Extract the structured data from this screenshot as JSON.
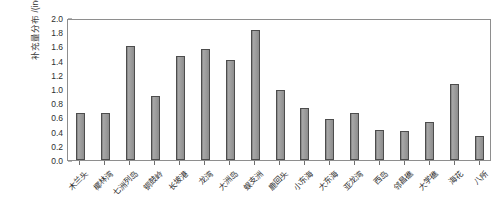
{
  "chart_data": {
    "type": "bar",
    "title": "",
    "xlabel": "",
    "ylabel": "补充量分布 /(ind./m²)",
    "ylabel_main": "补充量分布 /(ind./m",
    "ylabel_sup": "2",
    "ylabel_tail": ")",
    "ylim": [
      0.0,
      2.0
    ],
    "grid": false,
    "legend": "none",
    "ytick_labels": [
      "2.0",
      "1.8",
      "1.6",
      "1.4",
      "1.2",
      "1.0",
      "0.8",
      "0.6",
      "0.4",
      "0.2",
      "0.0"
    ],
    "ytick_values": [
      2.0,
      1.8,
      1.6,
      1.4,
      1.2,
      1.0,
      0.8,
      0.6,
      0.4,
      0.2,
      0.0
    ],
    "categories": [
      "木兰头",
      "椰林湾",
      "七洲列岛",
      "铜鼓岭",
      "长坡港",
      "龙湾",
      "大洲岛",
      "蜈支洲",
      "鹿回头",
      "小东海",
      "大东海",
      "亚龙湾",
      "西岛",
      "邻昌礁",
      "大学礁",
      "海花",
      "八所"
    ],
    "values": [
      0.67,
      0.67,
      1.63,
      0.92,
      1.49,
      1.58,
      1.43,
      1.86,
      1.0,
      0.75,
      0.59,
      0.67,
      0.43,
      0.42,
      0.54,
      1.09,
      0.35
    ],
    "bar_color": "#9a9a9a",
    "bar_edge_color": "#4d4d4d",
    "axis_color": "#8e8e8e"
  }
}
